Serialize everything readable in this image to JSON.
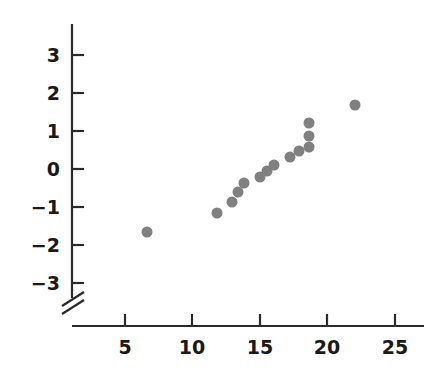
{
  "chart_data": {
    "type": "scatter",
    "title": "",
    "subtitle": "",
    "xlabel": "",
    "ylabel": "",
    "xlim": [
      0,
      27.5
    ],
    "ylim": [
      -3.6,
      3.6
    ],
    "xticks": [
      5,
      10,
      15,
      20,
      25
    ],
    "yticks": [
      3,
      2,
      1,
      0,
      -1,
      -2,
      -3
    ],
    "xtick_labels": [
      "5",
      "10",
      "15",
      "20",
      "25"
    ],
    "ytick_labels": [
      "3",
      "2",
      "1",
      "0",
      "−1",
      "−2",
      "−3"
    ],
    "grid": false,
    "legend": null,
    "axis_break": {
      "axis": "y",
      "position_label": "below -3",
      "style": "double-slash"
    },
    "marker": {
      "shape": "circle",
      "color": "#808080",
      "size_px": 11
    },
    "series": [
      {
        "name": "observations",
        "points": [
          {
            "x": 6.6,
            "y": -1.66
          },
          {
            "x": 11.8,
            "y": -1.16
          },
          {
            "x": 12.9,
            "y": -0.87
          },
          {
            "x": 13.4,
            "y": -0.61
          },
          {
            "x": 13.8,
            "y": -0.37
          },
          {
            "x": 15.0,
            "y": -0.21
          },
          {
            "x": 15.5,
            "y": -0.05
          },
          {
            "x": 16.0,
            "y": 0.11
          },
          {
            "x": 17.2,
            "y": 0.32
          },
          {
            "x": 17.9,
            "y": 0.47
          },
          {
            "x": 18.6,
            "y": 0.58
          },
          {
            "x": 18.6,
            "y": 0.87
          },
          {
            "x": 18.6,
            "y": 1.21
          },
          {
            "x": 22.0,
            "y": 1.68
          }
        ]
      }
    ],
    "n_points": 14
  },
  "axes": {
    "x_axis_color": "#2b2b2b",
    "y_axis_color": "#2b2b2b",
    "tick_color": "#2b2b2b"
  }
}
